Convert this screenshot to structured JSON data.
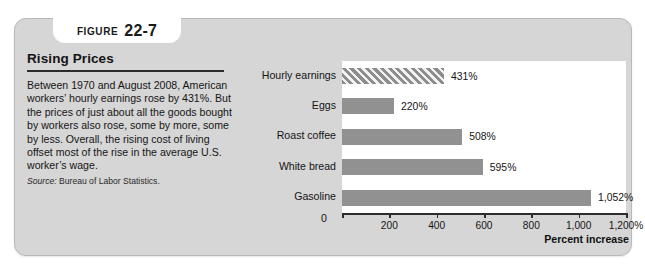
{
  "figure": {
    "tab_word": "FIGURE",
    "tab_number": "22-7",
    "title": "Rising Prices",
    "body": "Between 1970 and August 2008, American workers’ hourly earnings rose by 431%. But the prices of just about all the goods bought by workers also rose, some by more, some by less. Overall, the rising cost of living offset most of the rise in the average U.S. worker’s wage.",
    "source_label": "Source:",
    "source_text": "Bureau of Labor Statistics."
  },
  "colors": {
    "panel_background": "#d6d6d6",
    "plot_background": "#ffffff",
    "bar_fill": "#919191",
    "hatch_stripe": "#f2f2f2",
    "axis": "#2e2e2e",
    "text": "#141414"
  },
  "chart_data": {
    "type": "bar",
    "orientation": "horizontal",
    "title": "Rising Prices",
    "xlabel": "Percent increase",
    "ylabel": "",
    "xlim": [
      0,
      1200
    ],
    "grid": false,
    "legend": "none",
    "categories": [
      "Hourly earnings",
      "Eggs",
      "Roast coffee",
      "White bread",
      "Gasoline"
    ],
    "values": [
      431,
      220,
      508,
      595,
      1052
    ],
    "value_labels": [
      "431%",
      "220%",
      "508%",
      "595%",
      "1,052%"
    ],
    "bar_styles": [
      "hatched",
      "solid",
      "solid",
      "solid",
      "solid"
    ],
    "tick_values": [
      0,
      200,
      400,
      600,
      800,
      1000,
      1200
    ],
    "tick_labels": [
      "0",
      "200",
      "400",
      "600",
      "800",
      "1,000",
      "1,200%"
    ],
    "zero_tick_label": "0"
  }
}
